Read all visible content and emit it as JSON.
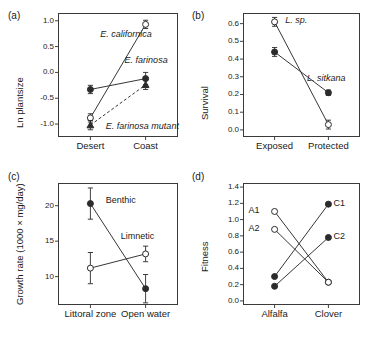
{
  "figure": {
    "background": "#ffffff",
    "line_color": "#2b2b2b",
    "frame_color": "#3a3a3a"
  },
  "panels": [
    {
      "letter": "(a)",
      "ylabel": "Ln plantsize",
      "yticks": [
        "1.0",
        "0.5",
        "0.0",
        "-0.5",
        "-1.0"
      ],
      "ytickvals": [
        1.0,
        0.5,
        0.0,
        -0.5,
        -1.0
      ],
      "xticks": [
        "Desert",
        "Coast"
      ]
    },
    {
      "letter": "(b)",
      "ylabel": "Survival",
      "yticks": [
        "0.6",
        "0.5",
        "0.4",
        "0.3",
        "0.2",
        "0.1",
        "0.0"
      ],
      "ytickvals": [
        0.6,
        0.5,
        0.4,
        0.3,
        0.2,
        0.1,
        0.0
      ],
      "xticks": [
        "Exposed",
        "Protected"
      ]
    },
    {
      "letter": "(c)",
      "ylabel": "Growth rate (1000 × mg/day)",
      "yticks": [
        "20",
        "15",
        "10"
      ],
      "ytickvals": [
        20,
        15,
        10
      ],
      "xticks": [
        "Littoral zone",
        "Open water"
      ]
    },
    {
      "letter": "(d)",
      "ylabel": "Fitness",
      "yticks": [
        "1.4",
        "1.2",
        "1.0",
        "0.8",
        "0.6",
        "0.4",
        "0.2",
        "0.0"
      ],
      "ytickvals": [
        1.4,
        1.2,
        1.0,
        0.8,
        0.6,
        0.4,
        0.2,
        0.0
      ],
      "xticks": [
        "Alfalfa",
        "Clover"
      ]
    }
  ],
  "chart_data": [
    {
      "type": "line",
      "panel": "(a)",
      "title": "",
      "xlabel": "",
      "ylabel": "Ln plantsize",
      "categories": [
        "Desert",
        "Coast"
      ],
      "ylim": [
        -1.25,
        1.15
      ],
      "grid": false,
      "legend": "inline-annotations",
      "series": [
        {
          "name": "E. californica",
          "marker": "open-circle",
          "linestyle": "solid",
          "values": [
            -0.88,
            0.93
          ],
          "errors": [
            0.08,
            0.08
          ],
          "label_x": 0.18,
          "label_y": 0.72
        },
        {
          "name": "E. farinosa",
          "marker": "filled-circle",
          "linestyle": "solid",
          "values": [
            -0.33,
            -0.12
          ],
          "errors": [
            0.08,
            0.12
          ],
          "label_x": 0.62,
          "label_y": 0.22
        },
        {
          "name": "E. farinosa mutant",
          "marker": "filled-triangle",
          "linestyle": "dashed",
          "values": [
            -1.02,
            -0.24
          ],
          "errors": [
            0.09,
            0.09
          ],
          "label_x": 0.28,
          "label_y": -1.05
        }
      ]
    },
    {
      "type": "line",
      "panel": "(b)",
      "title": "",
      "xlabel": "",
      "ylabel": "Survival",
      "categories": [
        "Exposed",
        "Protected"
      ],
      "ylim": [
        -0.04,
        0.66
      ],
      "grid": false,
      "legend": "inline-annotations",
      "series": [
        {
          "name": "L. sp.",
          "marker": "open-circle",
          "linestyle": "solid",
          "values": [
            0.61,
            0.03
          ],
          "errors": [
            0.025,
            0.025
          ],
          "label_x": 0.2,
          "label_y": 0.615
        },
        {
          "name": "L. sitkana",
          "marker": "filled-circle",
          "linestyle": "solid",
          "values": [
            0.44,
            0.21
          ],
          "errors": [
            0.025,
            0.015
          ],
          "label_x": 0.6,
          "label_y": 0.285
        }
      ]
    },
    {
      "type": "line",
      "panel": "(c)",
      "title": "",
      "xlabel": "",
      "ylabel": "Growth rate (1000 × mg/day)",
      "categories": [
        "Littoral zone",
        "Open water"
      ],
      "ylim": [
        6.0,
        23.2
      ],
      "grid": false,
      "legend": "inline-annotations",
      "series": [
        {
          "name": "Benthic",
          "marker": "filled-circle",
          "linestyle": "solid",
          "values": [
            20.3,
            8.3
          ],
          "errors": [
            2.2,
            2.0
          ],
          "label_x": 0.28,
          "label_y": 20.6
        },
        {
          "name": "Limnetic",
          "marker": "open-circle",
          "linestyle": "solid",
          "values": [
            11.2,
            13.2
          ],
          "errors": [
            2.2,
            1.1
          ],
          "label_x": 0.55,
          "label_y": 15.6
        }
      ]
    },
    {
      "type": "line",
      "panel": "(d)",
      "title": "",
      "xlabel": "",
      "ylabel": "Fitness",
      "categories": [
        "Alfalfa",
        "Clover"
      ],
      "ylim": [
        -0.05,
        1.45
      ],
      "grid": false,
      "legend": "inline-annotations",
      "series": [
        {
          "name": "A1",
          "marker": "open-circle",
          "linestyle": "solid",
          "values": [
            1.1,
            0.23
          ],
          "errors": [
            0,
            0
          ],
          "label_side": "left",
          "label_y": 1.1
        },
        {
          "name": "A2",
          "marker": "open-circle",
          "linestyle": "solid",
          "values": [
            0.88,
            0.23
          ],
          "errors": [
            0,
            0
          ],
          "label_side": "left",
          "label_y": 0.88
        },
        {
          "name": "C1",
          "marker": "filled-circle",
          "linestyle": "solid",
          "values": [
            0.3,
            1.19
          ],
          "errors": [
            0,
            0
          ],
          "label_side": "right",
          "label_y": 1.19
        },
        {
          "name": "C2",
          "marker": "filled-circle",
          "linestyle": "solid",
          "values": [
            0.18,
            0.78
          ],
          "errors": [
            0,
            0
          ],
          "label_side": "right",
          "label_y": 0.78
        }
      ]
    }
  ]
}
